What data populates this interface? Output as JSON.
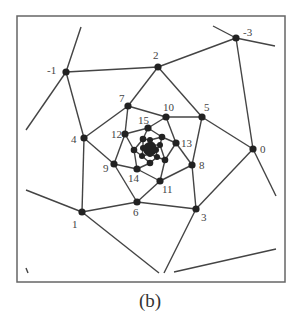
{
  "figure": {
    "caption": "(b)",
    "frame": {
      "x": 17,
      "y": 16,
      "width": 268,
      "height": 266
    },
    "colors": {
      "line": "#444444",
      "node": "#222222",
      "frame": "#666666",
      "label": "#444444"
    },
    "nodes": [
      {
        "id": "-3",
        "label": "-3",
        "x": 236,
        "y": 38,
        "lx": 243,
        "ly": 36
      },
      {
        "id": "-1",
        "label": "-1",
        "x": 66,
        "y": 72,
        "lx": 47,
        "ly": 74
      },
      {
        "id": "0",
        "label": "0",
        "x": 253,
        "y": 149,
        "lx": 260,
        "ly": 153
      },
      {
        "id": "1",
        "label": "1",
        "x": 82,
        "y": 212,
        "lx": 72,
        "ly": 228
      },
      {
        "id": "2",
        "label": "2",
        "x": 158,
        "y": 67,
        "lx": 153,
        "ly": 59
      },
      {
        "id": "3",
        "label": "3",
        "x": 196,
        "y": 209,
        "lx": 201,
        "ly": 221
      },
      {
        "id": "4",
        "label": "4",
        "x": 84,
        "y": 138,
        "lx": 71,
        "ly": 143
      },
      {
        "id": "5",
        "label": "5",
        "x": 202,
        "y": 117,
        "lx": 204,
        "ly": 111
      },
      {
        "id": "6",
        "label": "6",
        "x": 137,
        "y": 202,
        "lx": 133,
        "ly": 216
      },
      {
        "id": "7",
        "label": "7",
        "x": 128,
        "y": 106,
        "lx": 119,
        "ly": 102
      },
      {
        "id": "8",
        "label": "8",
        "x": 192,
        "y": 165,
        "lx": 199,
        "ly": 169
      },
      {
        "id": "9",
        "label": "9",
        "x": 114,
        "y": 164,
        "lx": 103,
        "ly": 172
      },
      {
        "id": "10",
        "label": "10",
        "x": 166,
        "y": 117,
        "lx": 163,
        "ly": 111
      },
      {
        "id": "11",
        "label": "11",
        "x": 160,
        "y": 181,
        "lx": 162,
        "ly": 193
      },
      {
        "id": "12",
        "label": "12",
        "x": 125,
        "y": 134,
        "lx": 111,
        "ly": 138
      },
      {
        "id": "13",
        "label": "13",
        "x": 176,
        "y": 143,
        "lx": 181,
        "ly": 147
      },
      {
        "id": "14",
        "label": "14",
        "x": 137,
        "y": 169,
        "lx": 128,
        "ly": 182
      },
      {
        "id": "15",
        "label": "15",
        "x": 148,
        "y": 128,
        "lx": 138,
        "ly": 124
      },
      {
        "id": "16",
        "label": "",
        "x": 134,
        "y": 150,
        "lx": 0,
        "ly": 0
      },
      {
        "id": "17",
        "label": "",
        "x": 150,
        "y": 163,
        "lx": 0,
        "ly": 0
      },
      {
        "id": "18",
        "label": "",
        "x": 165,
        "y": 160,
        "lx": 0,
        "ly": 0
      },
      {
        "id": "19",
        "label": "",
        "x": 162,
        "y": 137,
        "lx": 0,
        "ly": 0
      },
      {
        "id": "20",
        "label": "",
        "x": 143,
        "y": 139,
        "lx": 0,
        "ly": 0
      },
      {
        "id": "21",
        "label": "",
        "x": 142,
        "y": 156,
        "lx": 0,
        "ly": 0
      },
      {
        "id": "22",
        "label": "",
        "x": 157,
        "y": 157,
        "lx": 0,
        "ly": 0
      },
      {
        "id": "23",
        "label": "",
        "x": 160,
        "y": 145,
        "lx": 0,
        "ly": 0
      },
      {
        "id": "24",
        "label": "",
        "x": 150,
        "y": 140,
        "lx": 0,
        "ly": 0
      },
      {
        "id": "25",
        "label": "",
        "x": 143,
        "y": 148,
        "lx": 0,
        "ly": 0
      },
      {
        "id": "26",
        "label": "",
        "x": 150,
        "y": 154,
        "lx": 0,
        "ly": 0
      },
      {
        "id": "27",
        "label": "",
        "x": 156,
        "y": 150,
        "lx": 0,
        "ly": 0
      },
      {
        "id": "28",
        "label": "",
        "x": 152,
        "y": 145,
        "lx": 0,
        "ly": 0
      },
      {
        "id": "29",
        "label": "",
        "x": 147,
        "y": 148,
        "lx": 0,
        "ly": 0
      },
      {
        "id": "30",
        "label": "",
        "x": 151,
        "y": 151,
        "lx": 0,
        "ly": 0
      }
    ],
    "edges": [
      [
        "-3",
        "2"
      ],
      [
        "-3",
        "0"
      ],
      [
        "-1",
        "2"
      ],
      [
        "-1",
        "4"
      ],
      [
        "2",
        "7"
      ],
      [
        "2",
        "5"
      ],
      [
        "7",
        "4"
      ],
      [
        "7",
        "10"
      ],
      [
        "7",
        "12"
      ],
      [
        "5",
        "10"
      ],
      [
        "5",
        "0"
      ],
      [
        "5",
        "8"
      ],
      [
        "0",
        "3"
      ],
      [
        "4",
        "1"
      ],
      [
        "4",
        "9"
      ],
      [
        "1",
        "6"
      ],
      [
        "6",
        "3"
      ],
      [
        "3",
        "8"
      ],
      [
        "6",
        "9"
      ],
      [
        "6",
        "11"
      ],
      [
        "8",
        "11"
      ],
      [
        "8",
        "13"
      ],
      [
        "9",
        "12"
      ],
      [
        "9",
        "14"
      ],
      [
        "10",
        "15"
      ],
      [
        "10",
        "13"
      ],
      [
        "11",
        "14"
      ],
      [
        "11",
        "18"
      ],
      [
        "12",
        "15"
      ],
      [
        "12",
        "16"
      ],
      [
        "13",
        "19"
      ],
      [
        "13",
        "18"
      ],
      [
        "14",
        "16"
      ],
      [
        "14",
        "17"
      ],
      [
        "15",
        "20"
      ],
      [
        "15",
        "19"
      ],
      [
        "16",
        "21"
      ],
      [
        "16",
        "20"
      ],
      [
        "17",
        "21"
      ],
      [
        "17",
        "22"
      ],
      [
        "18",
        "22"
      ],
      [
        "18",
        "23"
      ],
      [
        "19",
        "23"
      ],
      [
        "19",
        "24"
      ],
      [
        "20",
        "24"
      ],
      [
        "20",
        "25"
      ],
      [
        "21",
        "25"
      ],
      [
        "21",
        "26"
      ],
      [
        "22",
        "26"
      ],
      [
        "22",
        "27"
      ],
      [
        "23",
        "27"
      ],
      [
        "23",
        "28"
      ],
      [
        "24",
        "28"
      ],
      [
        "24",
        "29"
      ],
      [
        "25",
        "29"
      ],
      [
        "26",
        "30"
      ],
      [
        "27",
        "30"
      ],
      [
        "28",
        "30"
      ],
      [
        "29",
        "30"
      ]
    ],
    "open_segments": [
      {
        "x1": 236,
        "y1": 38,
        "x2": 213,
        "y2": 26
      },
      {
        "x1": 236,
        "y1": 38,
        "x2": 275,
        "y2": 46
      },
      {
        "x1": 66,
        "y1": 72,
        "x2": 81,
        "y2": 27
      },
      {
        "x1": 66,
        "y1": 72,
        "x2": 26,
        "y2": 130
      },
      {
        "x1": 82,
        "y1": 212,
        "x2": 26,
        "y2": 190
      },
      {
        "x1": 82,
        "y1": 212,
        "x2": 159,
        "y2": 273
      },
      {
        "x1": 196,
        "y1": 209,
        "x2": 164,
        "y2": 273
      },
      {
        "x1": 253,
        "y1": 149,
        "x2": 276,
        "y2": 196
      },
      {
        "x1": 174,
        "y1": 272,
        "x2": 276,
        "y2": 249
      },
      {
        "x1": 26,
        "y1": 268,
        "x2": 28,
        "y2": 273
      }
    ]
  }
}
